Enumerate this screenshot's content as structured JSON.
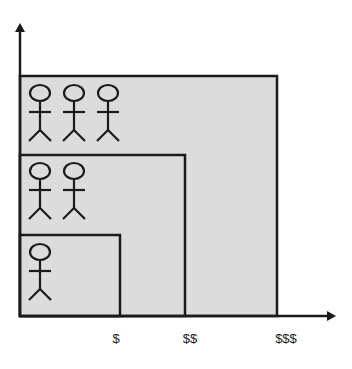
{
  "diagram": {
    "fill_color": "#dcdcdc",
    "stroke_color": "#1a1a1a",
    "x_labels": [
      "$",
      "$$",
      "$$$"
    ],
    "tiers": [
      {
        "label": "$",
        "people": 1
      },
      {
        "label": "$$",
        "people": 2
      },
      {
        "label": "$$$",
        "people": 3
      }
    ]
  }
}
